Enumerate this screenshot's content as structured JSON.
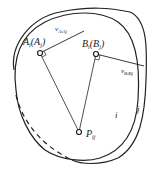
{
  "diagram": {
    "labels": {
      "point_a": "A",
      "point_a_sub": "i",
      "point_a_paren": "(A",
      "point_a_paren_sub": "j",
      "point_a_close": ")",
      "point_b": "B",
      "point_b_sub": "i",
      "point_b_paren": "(B",
      "point_b_paren_sub": "j",
      "point_b_close": ")",
      "velocity_a": "v",
      "velocity_a_sub": "AiAj",
      "velocity_b": "v",
      "velocity_b_sub": "BiBj",
      "pole": "P",
      "pole_sub": "ij",
      "body_i": "i",
      "body_j": "j"
    },
    "colors": {
      "stroke": "#222222",
      "background": "#ffffff"
    }
  }
}
